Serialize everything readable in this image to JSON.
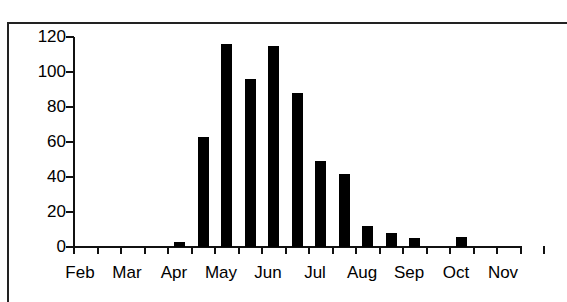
{
  "chart_data": {
    "type": "bar",
    "title": "",
    "xlabel": "",
    "ylabel": "",
    "ylim": [
      0,
      120
    ],
    "yticks": [
      0,
      20,
      40,
      60,
      80,
      100,
      120
    ],
    "x_tick_labels": [
      "Feb",
      "Mar",
      "Apr",
      "May",
      "Jun",
      "Jul",
      "Aug",
      "Sep",
      "Oct",
      "Nov"
    ],
    "bin_description": "half-month bins from start of Feb to start of Nov",
    "categories": [
      "Feb-1",
      "Feb-2",
      "Mar-1",
      "Mar-2",
      "Apr-1",
      "Apr-2",
      "May-1",
      "May-2",
      "Jun-1",
      "Jun-2",
      "Jul-1",
      "Jul-2",
      "Aug-1",
      "Aug-2",
      "Sep-1",
      "Sep-2",
      "Oct-1",
      "Oct-2"
    ],
    "values": [
      0,
      0,
      0,
      0,
      3,
      63,
      116,
      96,
      115,
      88,
      49,
      42,
      12,
      8,
      5,
      0,
      6,
      0
    ],
    "grid": false,
    "legend": null,
    "bar_color": "#000000"
  }
}
